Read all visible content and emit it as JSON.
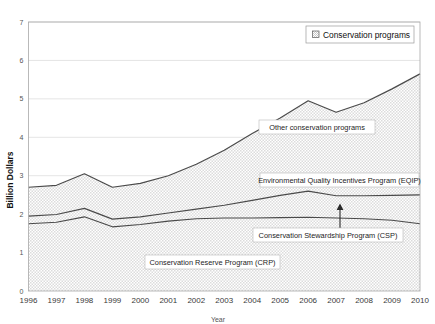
{
  "chart_data": {
    "type": "area",
    "title": "",
    "xlabel": "Year",
    "ylabel": "Billion Dollars",
    "ylim": [
      0,
      7
    ],
    "ytick_labels": [
      "0",
      "1",
      "2",
      "3",
      "4",
      "5",
      "6",
      "7"
    ],
    "grid": true,
    "stacked": true,
    "legend_position": "top-right",
    "legend_entries": [
      "Conservation programs"
    ],
    "categories": [
      "1996",
      "1997",
      "1998",
      "1999",
      "2000",
      "2001",
      "2002",
      "2003",
      "2004",
      "2005",
      "2006",
      "2007",
      "2008",
      "2009",
      "2010"
    ],
    "x": [
      1996,
      1997,
      1998,
      1999,
      2000,
      2001,
      2002,
      2003,
      2004,
      2005,
      2006,
      2007,
      2008,
      2009,
      2010
    ],
    "series": [
      {
        "name": "Conservation Reserve Program (CRP)",
        "values": [
          1.75,
          1.79,
          1.93,
          1.67,
          1.73,
          1.82,
          1.88,
          1.9,
          1.9,
          1.91,
          1.92,
          1.9,
          1.88,
          1.84,
          1.75
        ]
      },
      {
        "name": "Conservation Stewardship Program (CSP)",
        "values": [
          0.2,
          0.2,
          0.22,
          0.2,
          0.2,
          0.21,
          0.25,
          0.33,
          0.46,
          0.58,
          0.68,
          0.58,
          0.6,
          0.65,
          0.75
        ]
      },
      {
        "name": "Environmental Quality Incentives Program (EQIP)",
        "values": [
          0.75,
          0.76,
          0.9,
          0.83,
          0.87,
          0.97,
          1.17,
          1.43,
          1.74,
          2.01,
          2.35,
          2.17,
          2.42,
          2.77,
          3.15
        ]
      }
    ],
    "cumulative_boundaries": {
      "crp_top": [
        1.75,
        1.79,
        1.93,
        1.67,
        1.73,
        1.82,
        1.88,
        1.9,
        1.9,
        1.91,
        1.92,
        1.9,
        1.88,
        1.84,
        1.75
      ],
      "csp_top": [
        1.95,
        1.99,
        2.15,
        1.87,
        1.93,
        2.03,
        2.13,
        2.23,
        2.36,
        2.49,
        2.6,
        2.48,
        2.48,
        2.49,
        2.5
      ],
      "eqip_top": [
        2.7,
        2.75,
        3.05,
        2.7,
        2.8,
        3.0,
        3.3,
        3.66,
        4.1,
        4.5,
        4.95,
        4.65,
        4.9,
        5.26,
        5.65
      ]
    },
    "annotations": [
      {
        "label": "Other conservation programs",
        "target_series": "EQIP band"
      },
      {
        "label": "Environmental Quality Incentives Program (EQIP)",
        "target_series": "EQIP"
      },
      {
        "label": "Conservation Stewardship Program (CSP)",
        "target_series": "CSP",
        "has_arrow": true,
        "arrow_year": "2008"
      },
      {
        "label": "Conservation Reserve Program (CRP)",
        "target_series": "CRP"
      }
    ],
    "colors": {
      "area_fill": "#e3e3e3",
      "line": "#4a4a4a",
      "gridline": "#d9d9d9",
      "plot_border": "#a8a8a8",
      "background": "#ffffff"
    }
  }
}
